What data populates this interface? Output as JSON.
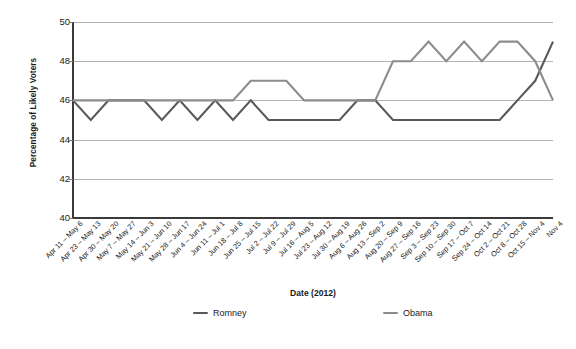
{
  "chart_data": {
    "type": "line",
    "title": "",
    "xlabel": "Date (2012)",
    "ylabel": "Percentage of Likely Voters",
    "ylim": [
      40,
      50
    ],
    "y_ticks": [
      40,
      42,
      44,
      46,
      48,
      50
    ],
    "grid": true,
    "legend_position": "bottom",
    "categories": [
      "Apr 11 – May 6",
      "Apr 23 – May 13",
      "Apr 30 – May 20",
      "May 7 – May 27",
      "May 14 – Jun 3",
      "May 21 – Jun 10",
      "May 28 – Jun 17",
      "Jun 4 – Jun 24",
      "Jun 11 – Jul 1",
      "Jun 18 – Jul 8",
      "Jun 25 – Jul 15",
      "Jul 2 – Jul 22",
      "Jul 9 – Jul 29",
      "Jul 16 – Aug 5",
      "Jul 23 – Aug 12",
      "Jul 30 – Aug 19",
      "Aug 6 – Aug 26",
      "Aug 13 – Sep 2",
      "Aug 20 – Sep 9",
      "Aug 27 – Sep 16",
      "Sep 3 – Sep 23",
      "Sep 10 – Sep 30",
      "Sep 17 – Oct 7",
      "Sep 24 – Oct 14",
      "Oct 2 – Oct 21",
      "Oct 8 – Oct 28",
      "Oct 15 – Nov 4",
      "Nov 4"
    ],
    "series": [
      {
        "name": "Romney",
        "color": "#595959",
        "values": [
          46,
          45,
          46,
          46,
          46,
          45,
          46,
          45,
          46,
          45,
          46,
          45,
          45,
          45,
          45,
          45,
          46,
          46,
          45,
          45,
          45,
          45,
          45,
          45,
          45,
          46,
          47,
          49
        ]
      },
      {
        "name": "Obama",
        "color": "#8c8c8c",
        "values": [
          46,
          46,
          46,
          46,
          46,
          46,
          46,
          46,
          46,
          46,
          47,
          47,
          47,
          46,
          46,
          46,
          46,
          46,
          48,
          48,
          49,
          48,
          49,
          48,
          49,
          49,
          48,
          46
        ]
      }
    ]
  },
  "legend": {
    "items": [
      {
        "label": "Romney",
        "color": "#595959"
      },
      {
        "label": "Obama",
        "color": "#8c8c8c"
      }
    ]
  },
  "axes": {
    "y_title": "Percentage of Likely Voters",
    "x_title": "Date (2012)"
  }
}
